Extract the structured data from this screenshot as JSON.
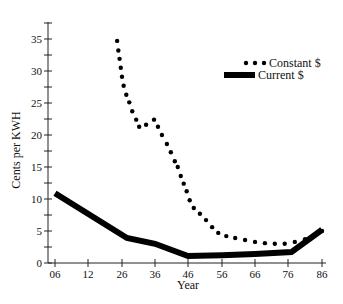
{
  "chart_data": {
    "type": "line",
    "title": "",
    "xlabel": "Year",
    "ylabel": "Cents per KWH",
    "x_tick_labels": [
      "06",
      "12",
      "26",
      "36",
      "46",
      "56",
      "66",
      "76",
      "86"
    ],
    "y_tick_labels": [
      "0",
      "5",
      "10",
      "15",
      "20",
      "25",
      "30",
      "35"
    ],
    "ylim": [
      0,
      38
    ],
    "grid": false,
    "legend_position": "upper right",
    "series": [
      {
        "name": "Constant $",
        "style": "dotted",
        "points": [
          [
            24,
            34.7
          ],
          [
            24.5,
            33.2
          ],
          [
            25,
            31.9
          ],
          [
            25.5,
            30.5
          ],
          [
            26,
            29.1
          ],
          [
            26.5,
            27.7
          ],
          [
            27.3,
            26.3
          ],
          [
            28.2,
            25.1
          ],
          [
            29.1,
            23.7
          ],
          [
            30.3,
            22.4
          ],
          [
            31.2,
            21.3
          ],
          [
            33.3,
            21.6
          ],
          [
            35.7,
            22.4
          ],
          [
            36.9,
            21.3
          ],
          [
            38.1,
            20.0
          ],
          [
            39.6,
            18.6
          ],
          [
            40.8,
            17.3
          ],
          [
            42,
            15.9
          ],
          [
            42.9,
            15.0
          ],
          [
            43.8,
            13.6
          ],
          [
            44.7,
            12.4
          ],
          [
            45.6,
            11.2
          ],
          [
            46.5,
            9.8
          ],
          [
            47.7,
            8.6
          ],
          [
            49.5,
            7.7
          ],
          [
            51.3,
            6.7
          ],
          [
            53.1,
            5.6
          ],
          [
            54.9,
            4.7
          ],
          [
            57.3,
            4.2
          ],
          [
            60,
            3.9
          ],
          [
            63,
            3.6
          ],
          [
            66,
            3.3
          ],
          [
            69,
            3.1
          ],
          [
            72,
            3.0
          ],
          [
            75,
            3.0
          ],
          [
            78,
            3.3
          ],
          [
            81,
            3.7
          ],
          [
            84,
            4.4
          ],
          [
            86,
            5.0
          ]
        ]
      },
      {
        "name": "Current $",
        "style": "thick solid",
        "points": [
          [
            6,
            10.9
          ],
          [
            27.5,
            3.9
          ],
          [
            36,
            3.0
          ],
          [
            46,
            1.1
          ],
          [
            56,
            1.2
          ],
          [
            66,
            1.4
          ],
          [
            77,
            1.7
          ],
          [
            86,
            5.2
          ]
        ]
      }
    ]
  },
  "legend": {
    "constant_label": "Constant $",
    "current_label": "Current $"
  },
  "axes": {
    "x_title": "Year",
    "y_title": "Cents per KWH"
  }
}
